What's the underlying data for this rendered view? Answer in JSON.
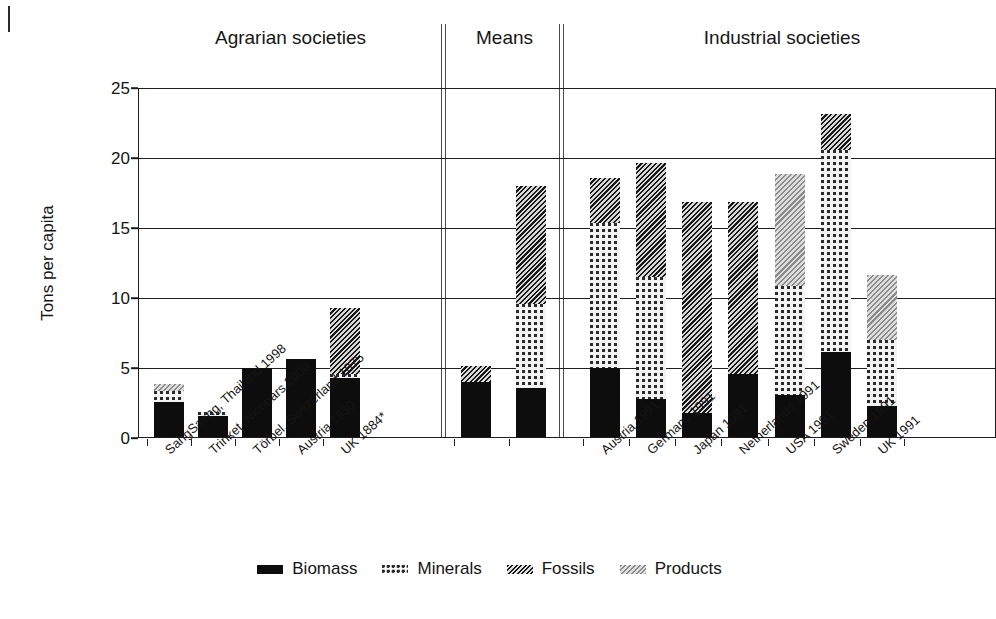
{
  "chart_data": {
    "type": "bar",
    "title": "",
    "xlabel": "",
    "ylabel": "Tons per capita",
    "ylim": [
      0,
      25
    ],
    "yticks": [
      0,
      5,
      10,
      15,
      20,
      25
    ],
    "grid": true,
    "stacked": true,
    "legend_position": "bottom",
    "legend": [
      "Biomass",
      "Minerals",
      "Fossils",
      "Products"
    ],
    "group_labels": [
      "Agrarian societies",
      "Means",
      "Industrial societies"
    ],
    "series": [
      {
        "name": "Biomass",
        "values": [
          2.5,
          1.5,
          4.9,
          5.6,
          4.2,
          3.9,
          3.5,
          4.9,
          2.7,
          1.7,
          4.5,
          3.0,
          6.1,
          2.2
        ]
      },
      {
        "name": "Minerals",
        "values": [
          0.8,
          0.3,
          0.0,
          0.0,
          0.3,
          0.0,
          6.0,
          10.4,
          8.7,
          0.0,
          0.0,
          7.8,
          14.4,
          4.7
        ]
      },
      {
        "name": "Fossils",
        "values": [
          0.0,
          0.0,
          0.0,
          0.0,
          4.7,
          1.2,
          8.4,
          3.2,
          8.2,
          15.1,
          12.3,
          0.0,
          2.6,
          0.0
        ]
      },
      {
        "name": "Products",
        "values": [
          0.5,
          0.0,
          0.0,
          0.0,
          0.0,
          0.0,
          0.0,
          0.0,
          0.0,
          0.0,
          0.0,
          8.0,
          0.0,
          4.7
        ]
      }
    ],
    "categories": [
      "SangSaeng, Thailand 1998",
      "Trinket, Nicobars 2000",
      "Törbel, Switzerland 1875",
      "Austria 1830",
      "UK 1884*",
      "",
      "",
      "Austria 1991",
      "Germany 1991",
      "Japan 1991",
      "Netherlands 1991",
      "USA 1991",
      "Sweden 1991",
      "UK 1991"
    ],
    "totals": [
      3.8,
      1.8,
      4.9,
      5.6,
      9.2,
      5.1,
      17.9,
      18.5,
      19.6,
      16.8,
      16.8,
      18.8,
      23.1,
      11.6
    ],
    "colors": {
      "biomass": "#0d0d0d",
      "minerals": "#f2f2f2",
      "fossils": "#6e6e6e",
      "products": "#b4b4b4",
      "axis": "#1d1d1d",
      "text": "#141414"
    }
  },
  "groups": [
    {
      "label": "Agrarian societies"
    },
    {
      "label": "Means"
    },
    {
      "label": "Industrial societies"
    }
  ],
  "yaxis": {
    "title": "Tons per capita",
    "ticks": [
      "25",
      "20",
      "15",
      "10",
      "5",
      "0"
    ]
  },
  "legend": {
    "items": [
      {
        "label": "Biomass",
        "swatch": "biomass-swatch-icon"
      },
      {
        "label": "Minerals",
        "swatch": "minerals-swatch-icon"
      },
      {
        "label": "Fossils",
        "swatch": "fossils-swatch-icon"
      },
      {
        "label": "Products",
        "swatch": "products-swatch-icon"
      }
    ]
  }
}
